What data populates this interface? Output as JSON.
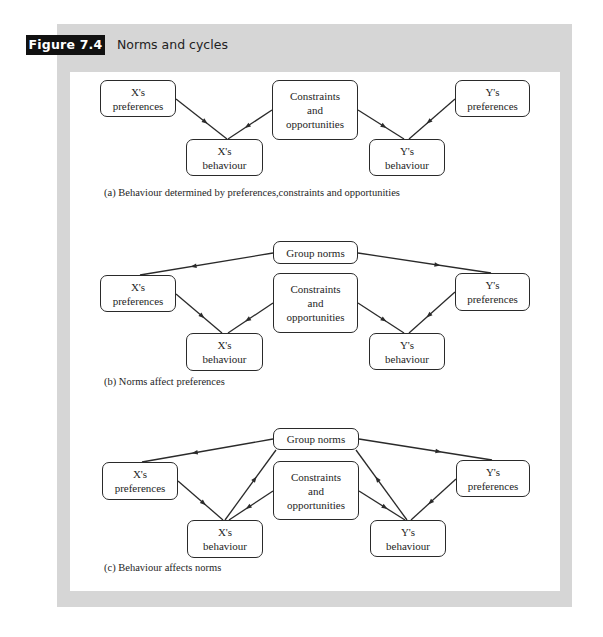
{
  "figure": {
    "label": "Figure 7.4",
    "title": "Norms and cycles",
    "colors": {
      "frame": "#d6d6d6",
      "panel": "#ffffff",
      "label_bg": "#111111",
      "ink": "#2a2a2a"
    }
  },
  "panels": [
    {
      "id": "a",
      "caption": "(a) Behaviour determined by preferences,constraints and opportunities",
      "caption_pos": {
        "x": 104,
        "y": 194
      },
      "nodes": {
        "x_pref": {
          "text": "X's\npreferences",
          "x": 100,
          "y": 80,
          "w": 76,
          "h": 37
        },
        "x_beh": {
          "text": "X's\nbehaviour",
          "x": 186,
          "y": 139,
          "w": 77,
          "h": 37
        },
        "constr": {
          "text": "Constraints\nand\nopportunities",
          "x": 272,
          "y": 80,
          "w": 86,
          "h": 60
        },
        "y_beh": {
          "text": "Y's\nbehaviour",
          "x": 369,
          "y": 139,
          "w": 76,
          "h": 37
        },
        "y_pref": {
          "text": "Y's\npreferences",
          "x": 455,
          "y": 80,
          "w": 75,
          "h": 37
        }
      },
      "edges": [
        {
          "from": [
            176,
            99
          ],
          "to": [
            227,
            139
          ]
        },
        {
          "from": [
            272,
            110
          ],
          "to": [
            228,
            139
          ]
        },
        {
          "from": [
            358,
            110
          ],
          "to": [
            404,
            139
          ]
        },
        {
          "from": [
            455,
            99
          ],
          "to": [
            409,
            139
          ]
        }
      ]
    },
    {
      "id": "b",
      "caption": "(b) Norms affect preferences",
      "caption_pos": {
        "x": 104,
        "y": 383
      },
      "nodes": {
        "norms": {
          "text": "Group norms",
          "x": 273,
          "y": 241,
          "w": 85,
          "h": 23
        },
        "x_pref": {
          "text": "X's\npreferences",
          "x": 100,
          "y": 275,
          "w": 76,
          "h": 37
        },
        "x_beh": {
          "text": "X's\nbehaviour",
          "x": 186,
          "y": 333,
          "w": 77,
          "h": 38
        },
        "constr": {
          "text": "Constraints\nand\nopportunities",
          "x": 273,
          "y": 273,
          "w": 85,
          "h": 60
        },
        "y_beh": {
          "text": "Y's\nbehaviour",
          "x": 369,
          "y": 333,
          "w": 76,
          "h": 37
        },
        "y_pref": {
          "text": "Y's\npreferences",
          "x": 455,
          "y": 273,
          "w": 75,
          "h": 38
        }
      },
      "edges": [
        {
          "from": [
            273,
            253
          ],
          "to": [
            140,
            275
          ]
        },
        {
          "from": [
            358,
            253
          ],
          "to": [
            491,
            273
          ]
        },
        {
          "from": [
            176,
            294
          ],
          "to": [
            222,
            333
          ]
        },
        {
          "from": [
            273,
            303
          ],
          "to": [
            228,
            333
          ]
        },
        {
          "from": [
            358,
            303
          ],
          "to": [
            404,
            333
          ]
        },
        {
          "from": [
            455,
            292
          ],
          "to": [
            409,
            333
          ]
        }
      ]
    },
    {
      "id": "c",
      "caption": "(c) Behaviour affects norms",
      "caption_pos": {
        "x": 104,
        "y": 569
      },
      "nodes": {
        "norms": {
          "text": "Group norms",
          "x": 273,
          "y": 428,
          "w": 86,
          "h": 22
        },
        "x_pref": {
          "text": "X's\npreferences",
          "x": 102,
          "y": 462,
          "w": 76,
          "h": 38
        },
        "x_beh": {
          "text": "X's\nbehaviour",
          "x": 187,
          "y": 520,
          "w": 76,
          "h": 38
        },
        "constr": {
          "text": "Constraints\nand\nopportunities",
          "x": 273,
          "y": 461,
          "w": 86,
          "h": 59
        },
        "y_beh": {
          "text": "Y's\nbehaviour",
          "x": 370,
          "y": 520,
          "w": 76,
          "h": 37
        },
        "y_pref": {
          "text": "Y's\npreferences",
          "x": 456,
          "y": 460,
          "w": 74,
          "h": 37
        }
      },
      "edges": [
        {
          "from": [
            273,
            439
          ],
          "to": [
            142,
            462
          ]
        },
        {
          "from": [
            359,
            439
          ],
          "to": [
            492,
            460
          ]
        },
        {
          "from": [
            178,
            481
          ],
          "to": [
            223,
            520
          ]
        },
        {
          "from": [
            273,
            491
          ],
          "to": [
            229,
            520
          ]
        },
        {
          "from": [
            359,
            491
          ],
          "to": [
            405,
            520
          ]
        },
        {
          "from": [
            456,
            479
          ],
          "to": [
            411,
            520
          ]
        },
        {
          "from": [
            225,
            520
          ],
          "to": [
            276,
            450
          ]
        },
        {
          "from": [
            407,
            520
          ],
          "to": [
            356,
            450
          ]
        }
      ]
    }
  ]
}
